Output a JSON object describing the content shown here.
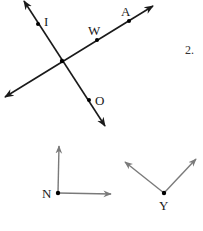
{
  "problem_number": "2.",
  "colors": {
    "dark_line": "#1a1a1a",
    "gray_ray": "#7a7a7a",
    "point": "#000000",
    "background": "#ffffff"
  },
  "figure_top": {
    "description": "Two intersecting lines",
    "intersection": {
      "x": 62,
      "y": 61
    },
    "lines": [
      {
        "name": "line-IO",
        "from": {
          "x": 24,
          "y": 1
        },
        "to": {
          "x": 105,
          "y": 126
        },
        "arrows": [
          "start",
          "end"
        ],
        "points": [
          {
            "label": "I",
            "x": 38,
            "y": 24,
            "label_x": 44,
            "label_y": 26
          },
          {
            "label": "O",
            "x": 89,
            "y": 100,
            "label_x": 95,
            "label_y": 105
          }
        ]
      },
      {
        "name": "line-WA",
        "from": {
          "x": 5,
          "y": 97
        },
        "to": {
          "x": 153,
          "y": 6
        },
        "arrows": [
          "start",
          "end"
        ],
        "points": [
          {
            "label": "W",
            "x": 97,
            "y": 40,
            "label_x": 88,
            "label_y": 35
          },
          {
            "label": "A",
            "x": 129,
            "y": 21,
            "label_x": 121,
            "label_y": 16
          }
        ]
      }
    ]
  },
  "figure_bottom": {
    "angles": [
      {
        "vertex_label": "N",
        "vertex": {
          "x": 58,
          "y": 193
        },
        "label_pos": {
          "x": 42,
          "y": 198
        },
        "rays": [
          {
            "to": {
              "x": 59,
              "y": 145
            }
          },
          {
            "to": {
              "x": 112,
              "y": 194
            }
          }
        ]
      },
      {
        "vertex_label": "Y",
        "vertex": {
          "x": 164,
          "y": 193
        },
        "label_pos": {
          "x": 159,
          "y": 210
        },
        "rays": [
          {
            "to": {
              "x": 124,
              "y": 161
            }
          },
          {
            "to": {
              "x": 197,
              "y": 158
            }
          }
        ]
      }
    ]
  }
}
